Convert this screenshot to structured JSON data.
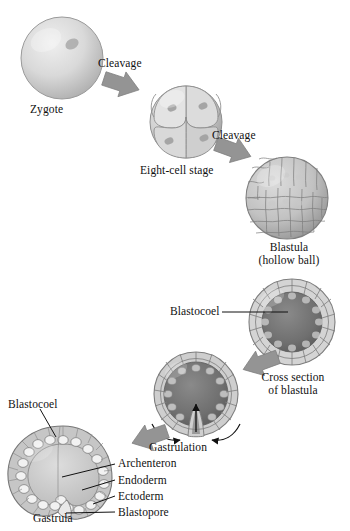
{
  "figure": {
    "background_color": "#ffffff",
    "text_color": "#111111",
    "cell_fill_light": "#d8d8d8",
    "cell_fill_mid": "#b9b9b9",
    "cell_fill_dark": "#8d8d8d",
    "cavity_dark": "#6f6f6f",
    "arrow_color": "#949494",
    "outline_color": "#5a5a5a"
  },
  "stages": [
    {
      "id": "zygote",
      "label": "Zygote",
      "description": "single large cell with nucleus"
    },
    {
      "id": "eight-cell",
      "label": "Eight-cell stage",
      "description": "eight blastomeres each with a nucleus"
    },
    {
      "id": "blastula",
      "label": "Blastula",
      "sublabel": "(hollow ball)",
      "description": "sphere covered in many small cells"
    },
    {
      "id": "cross-section-blastula",
      "label": "Cross section",
      "sublabel": "of blastula",
      "description": "ring of cells around dark central cavity"
    },
    {
      "id": "gastrulation",
      "label": "Gastrulation",
      "description": "invagination of the vegetal pole"
    },
    {
      "id": "gastrula",
      "label": "Gastrula",
      "description": "two-layered embryo with archenteron"
    }
  ],
  "process_arrows": [
    {
      "id": "cleavage-1",
      "label": "Cleavage"
    },
    {
      "id": "cleavage-2",
      "label": "Cleavage"
    }
  ],
  "callouts": [
    {
      "id": "blastocoel-cross-section",
      "label": "Blastocoel"
    },
    {
      "id": "blastocoel-gastrula",
      "label": "Blastocoel"
    },
    {
      "id": "archenteron",
      "label": "Archenteron"
    },
    {
      "id": "endoderm",
      "label": "Endoderm"
    },
    {
      "id": "ectoderm",
      "label": "Ectoderm"
    },
    {
      "id": "blastopore",
      "label": "Blastopore"
    }
  ]
}
